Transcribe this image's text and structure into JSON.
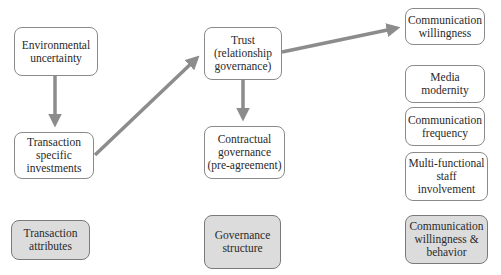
{
  "diagram": {
    "nodes": {
      "environmental_uncertainty": "Environmental\nuncertainty",
      "transaction_specific_investments": "Transaction\nspecific\ninvestments",
      "trust": "Trust\n(relationship\ngovernance)",
      "contractual_governance": "Contractual\ngovernance\n(pre-agreement)",
      "communication_willingness": "Communication\nwillingness",
      "media_modernity": "Media\nmodernity",
      "communication_frequency": "Communication\nfrequency",
      "multi_functional_staff": "Multi-functional\nstaff\ninvolvement"
    },
    "categories": {
      "transaction_attributes": "Transaction\nattributes",
      "governance_structure": "Governance\nstructure",
      "communication_behavior": "Communication\nwillingness &\nbehavior"
    },
    "edges": [
      {
        "from": "Environmental uncertainty",
        "to": "Transaction specific investments"
      },
      {
        "from": "Transaction specific investments",
        "to": "Trust (relationship governance)"
      },
      {
        "from": "Trust (relationship governance)",
        "to": "Contractual governance (pre-agreement)"
      },
      {
        "from": "Trust (relationship governance)",
        "to": "Communication willingness"
      }
    ],
    "colors": {
      "arrow": "#8c8c8c",
      "box_border": "#8a8a8a",
      "category_fill": "#dcdcdc"
    }
  }
}
